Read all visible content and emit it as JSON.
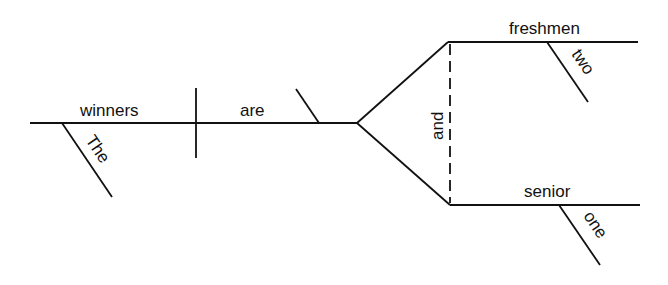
{
  "diagram": {
    "type": "sentence-diagram",
    "sentence_words": {
      "subject": "winners",
      "subject_modifier": "The",
      "verb": "are",
      "conjunction": "and",
      "complement_top": "freshmen",
      "complement_top_modifier": "two",
      "complement_bottom": "senior",
      "complement_bottom_modifier": "one"
    },
    "colors": {
      "line": "#111111",
      "background": "#ffffff"
    }
  }
}
